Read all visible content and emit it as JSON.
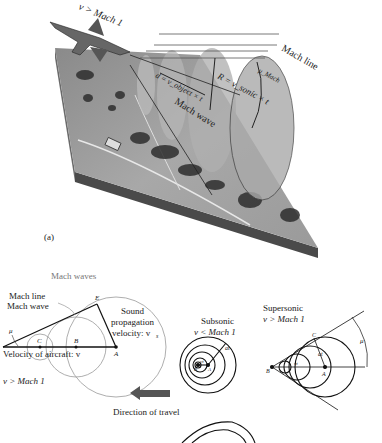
{
  "panel_a": {
    "label": "(a)",
    "speed_label": "v > Mach 1",
    "mach_line_label": "Mach line",
    "mach_wave_label": "Mach wave",
    "distance_formula": "d = v_object × t",
    "radius_formula": "R = v_sonic × t",
    "mu_label": "μ_Mach"
  },
  "panel_b": {
    "title": "Mach waves",
    "mach_line_label": "Mach line",
    "mach_wave_label": "Mach wave",
    "mu_label": "μ",
    "point_e": "E",
    "point_c": "C",
    "point_b": "B",
    "point_a": "A",
    "sound_label_1": "Sound",
    "sound_label_2": "propagation",
    "sound_label_3": "velocity: v",
    "sound_label_sub": "s",
    "aircraft_velocity_label": "Velocity of aircraft: v",
    "speed_condition": "v > Mach 1",
    "direction_label": "Direction of travel",
    "direction_arrow_color": "#555555"
  },
  "subsonic": {
    "title": "Subsonic",
    "condition": "v < Mach 1",
    "at_label": "at",
    "vt_label": "vt",
    "point_a": "A",
    "point_b": "B"
  },
  "supersonic": {
    "title": "Supersonic",
    "condition": "v > Mach 1",
    "at_label": "at",
    "vt_label": "vt",
    "point_a": "A",
    "point_b": "B",
    "point_c": "C",
    "mu_label": "μ"
  }
}
